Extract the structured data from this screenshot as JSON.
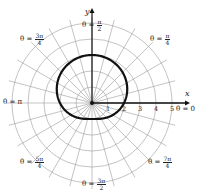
{
  "chart_data": {
    "type": "polar",
    "title": "",
    "equation": "r = 2 + sin θ",
    "center_px": [
      92,
      103
    ],
    "px_per_unit": 16,
    "rings": [
      1,
      2,
      3,
      4,
      5
    ],
    "radial_step_deg": 15,
    "radial_ticks": [
      "1",
      "2",
      "3",
      "4",
      "5"
    ],
    "axis_labels": {
      "x": "x",
      "y": "y"
    },
    "angle_labels": [
      {
        "id": "zero",
        "prefix": "θ = ",
        "value": "0"
      },
      {
        "id": "pi4",
        "prefix": "θ = ",
        "num": "π",
        "den": "4"
      },
      {
        "id": "pi2",
        "prefix": "θ = ",
        "num": "π",
        "den": "2"
      },
      {
        "id": "3pi4",
        "prefix": "θ = ",
        "num": "3π",
        "den": "4"
      },
      {
        "id": "pi",
        "prefix": "θ = ",
        "value": "π"
      },
      {
        "id": "5pi4",
        "prefix": "θ = ",
        "num": "5π",
        "den": "4"
      },
      {
        "id": "3pi2",
        "prefix": "θ = ",
        "num": "3π",
        "den": "2"
      },
      {
        "id": "7pi4",
        "prefix": "θ = ",
        "num": "7π",
        "den": "4"
      }
    ],
    "curve_samples": [
      {
        "theta": "0",
        "r": 2
      },
      {
        "theta": "π/2",
        "r": 3
      },
      {
        "theta": "π",
        "r": 2
      },
      {
        "theta": "3π/2",
        "r": 1
      }
    ],
    "colors": {
      "grid": "#9a9a9a",
      "curve": "#111111",
      "axis": "#111111"
    }
  }
}
